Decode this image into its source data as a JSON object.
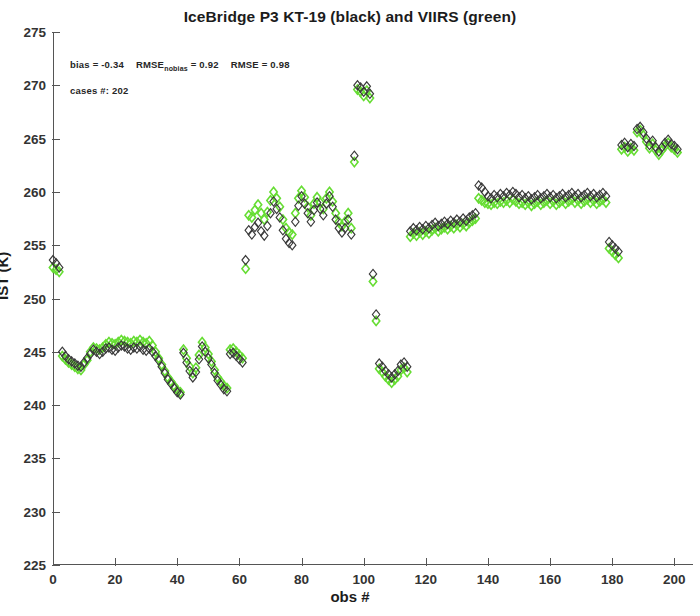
{
  "chart_data": {
    "type": "scatter",
    "title": "IceBridge P3 KT-19 (black) and VIIRS (green)",
    "xlabel": "obs #",
    "ylabel": "IST (K)",
    "xlim": [
      0,
      206
    ],
    "ylim": [
      225,
      275
    ],
    "xticks": [
      0,
      20,
      40,
      60,
      80,
      100,
      120,
      140,
      160,
      180,
      200
    ],
    "yticks": [
      225,
      230,
      235,
      240,
      245,
      250,
      255,
      260,
      265,
      270,
      275
    ],
    "grid": false,
    "legend": "in-title",
    "marker": "diamond-open",
    "annotations": {
      "bias_label": "bias = ",
      "bias_value": "-0.34",
      "rmse_nobias_label": "RMSE",
      "rmse_nobias_sub": "nobias",
      "rmse_nobias_value": " = 0.92",
      "rmse_label": "RMSE = ",
      "rmse_value": "0.98",
      "cases_label": "cases #: ",
      "cases_value": "202"
    },
    "colors": {
      "black_series": "#3a3a3a",
      "green_series": "#66dd33",
      "axis": "#555555",
      "background": "#ffffff"
    },
    "series": [
      {
        "name": "KT-19 (black)",
        "color": "#3a3a3a",
        "x": [
          0,
          1,
          2,
          3,
          4,
          5,
          6,
          7,
          8,
          9,
          10,
          11,
          12,
          13,
          14,
          15,
          16,
          17,
          18,
          19,
          20,
          21,
          22,
          23,
          24,
          25,
          26,
          27,
          28,
          29,
          30,
          31,
          32,
          33,
          34,
          35,
          36,
          37,
          38,
          39,
          40,
          41,
          42,
          43,
          44,
          45,
          46,
          47,
          48,
          49,
          50,
          51,
          52,
          53,
          54,
          55,
          56,
          57,
          58,
          59,
          60,
          61,
          62,
          63,
          64,
          65,
          66,
          67,
          68,
          69,
          70,
          71,
          72,
          73,
          74,
          75,
          76,
          77,
          78,
          79,
          80,
          81,
          82,
          83,
          84,
          85,
          86,
          87,
          88,
          89,
          90,
          91,
          92,
          93,
          94,
          95,
          96,
          97,
          98,
          99,
          100,
          101,
          102,
          103,
          104,
          105,
          106,
          107,
          108,
          109,
          110,
          111,
          112,
          113,
          114,
          115,
          116,
          117,
          118,
          119,
          120,
          121,
          122,
          123,
          124,
          125,
          126,
          127,
          128,
          129,
          130,
          131,
          132,
          133,
          134,
          135,
          136,
          137,
          138,
          139,
          140,
          141,
          142,
          143,
          144,
          145,
          146,
          147,
          148,
          149,
          150,
          151,
          152,
          153,
          154,
          155,
          156,
          157,
          158,
          159,
          160,
          161,
          162,
          163,
          164,
          165,
          166,
          167,
          168,
          169,
          170,
          171,
          172,
          173,
          174,
          175,
          176,
          177,
          178,
          179,
          180,
          181,
          182,
          183,
          184,
          185,
          186,
          187,
          188,
          189,
          190,
          191,
          192,
          193,
          194,
          195,
          196,
          197,
          198,
          199,
          200,
          201
        ],
        "y": [
          253.6,
          253.3,
          252.9,
          245.0,
          244.6,
          244.3,
          244.1,
          243.9,
          243.7,
          243.6,
          244.0,
          244.4,
          244.8,
          245.2,
          245.0,
          244.8,
          245.0,
          245.3,
          245.4,
          245.2,
          245.1,
          245.4,
          245.6,
          245.5,
          245.3,
          245.2,
          245.4,
          245.3,
          245.5,
          245.2,
          245.1,
          245.3,
          245.0,
          244.6,
          244.2,
          243.6,
          243.0,
          242.4,
          242.0,
          241.6,
          241.2,
          241.0,
          244.9,
          244.0,
          243.2,
          242.6,
          243.1,
          244.3,
          245.5,
          245.0,
          244.4,
          243.8,
          243.0,
          242.3,
          241.9,
          241.5,
          241.3,
          244.8,
          244.9,
          244.6,
          244.3,
          244.0,
          253.6,
          256.4,
          256.0,
          256.7,
          257.1,
          256.3,
          255.9,
          256.8,
          258.0,
          259.1,
          258.4,
          257.6,
          256.4,
          255.6,
          255.2,
          255.0,
          257.2,
          258.7,
          259.6,
          258.9,
          258.0,
          257.2,
          258.3,
          259.0,
          258.4,
          257.8,
          258.9,
          259.6,
          258.6,
          257.4,
          256.6,
          256.2,
          256.6,
          257.4,
          256.0,
          263.4,
          270.0,
          269.8,
          269.4,
          269.9,
          269.2,
          252.3,
          248.5,
          243.9,
          243.6,
          243.2,
          242.9,
          242.6,
          242.9,
          243.2,
          243.8,
          244.0,
          243.6,
          256.3,
          256.6,
          256.4,
          256.7,
          256.5,
          256.8,
          256.6,
          256.9,
          257.1,
          256.8,
          257.0,
          257.2,
          257.0,
          257.3,
          257.1,
          257.4,
          257.2,
          257.5,
          257.3,
          257.6,
          257.8,
          258.0,
          260.6,
          260.4,
          260.0,
          259.6,
          259.4,
          259.7,
          259.5,
          259.8,
          259.6,
          259.9,
          259.7,
          260.0,
          259.8,
          259.5,
          259.7,
          259.4,
          259.6,
          259.3,
          259.5,
          259.7,
          259.4,
          259.6,
          259.8,
          259.5,
          259.7,
          259.4,
          259.6,
          259.8,
          259.5,
          259.7,
          259.9,
          259.6,
          259.8,
          259.5,
          259.7,
          259.9,
          259.6,
          259.8,
          259.5,
          259.7,
          259.9,
          259.6,
          255.3,
          255.0,
          254.7,
          254.4,
          264.4,
          264.6,
          264.2,
          264.5,
          264.3,
          265.9,
          266.1,
          265.6,
          265.0,
          264.4,
          264.8,
          264.2,
          263.8,
          264.2,
          264.6,
          264.9,
          264.5,
          264.3,
          264.0
        ]
      },
      {
        "name": "VIIRS (green)",
        "color": "#66dd33",
        "x": [
          0,
          1,
          2,
          3,
          4,
          5,
          6,
          7,
          8,
          9,
          10,
          11,
          12,
          13,
          14,
          15,
          16,
          17,
          18,
          19,
          20,
          21,
          22,
          23,
          24,
          25,
          26,
          27,
          28,
          29,
          30,
          31,
          32,
          33,
          34,
          35,
          36,
          37,
          38,
          39,
          40,
          41,
          42,
          43,
          44,
          45,
          46,
          47,
          48,
          49,
          50,
          51,
          52,
          53,
          54,
          55,
          56,
          57,
          58,
          59,
          60,
          61,
          62,
          63,
          64,
          65,
          66,
          67,
          68,
          69,
          70,
          71,
          72,
          73,
          74,
          75,
          76,
          77,
          78,
          79,
          80,
          81,
          82,
          83,
          84,
          85,
          86,
          87,
          88,
          89,
          90,
          91,
          92,
          93,
          94,
          95,
          96,
          97,
          98,
          99,
          100,
          101,
          102,
          103,
          104,
          105,
          106,
          107,
          108,
          109,
          110,
          111,
          112,
          113,
          114,
          115,
          116,
          117,
          118,
          119,
          120,
          121,
          122,
          123,
          124,
          125,
          126,
          127,
          128,
          129,
          130,
          131,
          132,
          133,
          134,
          135,
          136,
          137,
          138,
          139,
          140,
          141,
          142,
          143,
          144,
          145,
          146,
          147,
          148,
          149,
          150,
          151,
          152,
          153,
          154,
          155,
          156,
          157,
          158,
          159,
          160,
          161,
          162,
          163,
          164,
          165,
          166,
          167,
          168,
          169,
          170,
          171,
          172,
          173,
          174,
          175,
          176,
          177,
          178,
          179,
          180,
          181,
          182,
          183,
          184,
          185,
          186,
          187,
          188,
          189,
          190,
          191,
          192,
          193,
          194,
          195,
          196,
          197,
          198,
          199,
          200,
          201
        ],
        "y": [
          252.9,
          252.7,
          252.5,
          244.6,
          244.3,
          244.0,
          243.8,
          243.6,
          243.4,
          243.3,
          243.8,
          244.2,
          245.0,
          245.4,
          245.3,
          245.2,
          245.4,
          245.7,
          245.9,
          245.8,
          245.7,
          245.9,
          246.1,
          246.0,
          245.9,
          245.8,
          246.0,
          245.9,
          246.1,
          245.9,
          245.8,
          246.0,
          245.6,
          245.0,
          244.4,
          243.8,
          243.2,
          242.6,
          242.2,
          241.8,
          241.4,
          241.2,
          245.2,
          244.4,
          243.6,
          243.0,
          243.5,
          244.7,
          245.9,
          245.4,
          244.8,
          244.1,
          243.3,
          242.6,
          242.2,
          241.8,
          241.6,
          245.2,
          245.3,
          245.0,
          244.7,
          244.4,
          252.8,
          257.8,
          257.6,
          258.3,
          258.8,
          258.0,
          257.4,
          258.1,
          259.2,
          260.0,
          259.4,
          258.6,
          257.4,
          256.6,
          256.2,
          256.0,
          258.0,
          259.4,
          260.1,
          259.5,
          258.6,
          257.8,
          258.9,
          259.5,
          259.0,
          258.4,
          259.4,
          260.0,
          259.1,
          258.0,
          257.2,
          256.8,
          257.2,
          258.0,
          256.6,
          262.8,
          269.6,
          269.4,
          269.0,
          269.5,
          268.8,
          251.6,
          247.9,
          243.4,
          243.1,
          242.7,
          242.4,
          242.1,
          242.4,
          242.7,
          243.3,
          243.5,
          243.1,
          255.8,
          256.1,
          255.9,
          256.2,
          256.0,
          256.3,
          256.1,
          256.4,
          256.6,
          256.3,
          256.5,
          256.7,
          256.5,
          256.8,
          256.6,
          256.9,
          256.7,
          257.0,
          256.8,
          257.1,
          257.3,
          257.5,
          259.4,
          259.2,
          259.0,
          258.9,
          258.8,
          259.0,
          258.9,
          259.1,
          259.0,
          259.2,
          259.0,
          259.3,
          259.1,
          258.9,
          259.0,
          258.8,
          259.0,
          258.7,
          258.9,
          259.1,
          258.8,
          259.0,
          259.2,
          258.9,
          259.1,
          258.8,
          259.0,
          259.2,
          258.9,
          259.1,
          259.3,
          259.0,
          259.2,
          258.9,
          259.1,
          259.3,
          259.0,
          259.2,
          258.9,
          259.1,
          259.3,
          259.0,
          254.7,
          254.4,
          254.1,
          253.8,
          264.0,
          264.2,
          263.8,
          264.1,
          263.9,
          265.6,
          265.8,
          265.3,
          264.7,
          264.1,
          264.5,
          263.9,
          263.5,
          263.9,
          264.3,
          264.6,
          264.2,
          264.0,
          263.7
        ]
      }
    ]
  }
}
